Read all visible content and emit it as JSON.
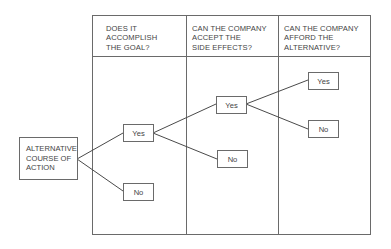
{
  "diagram": {
    "type": "decision-tree",
    "root": {
      "label_lines": [
        "ALTERNATIVE",
        "COURSE OF",
        "ACTION"
      ]
    },
    "columns": [
      {
        "header_lines": [
          "DOES IT",
          "ACCOMPLISH",
          "THE GOAL?"
        ]
      },
      {
        "header_lines": [
          "CAN THE COMPANY",
          "ACCEPT THE",
          "SIDE EFFECTS?"
        ]
      },
      {
        "header_lines": [
          "CAN THE COMPANY",
          "AFFORD THE",
          "ALTERNATIVE?"
        ]
      }
    ],
    "nodes": {
      "goal_yes": "Yes",
      "goal_no": "No",
      "side_effects_yes": "Yes",
      "side_effects_no": "No",
      "afford_yes": "Yes",
      "afford_no": "No"
    },
    "edges": [
      {
        "from": "root",
        "to": "goal_yes"
      },
      {
        "from": "root",
        "to": "goal_no"
      },
      {
        "from": "goal_yes",
        "to": "side_effects_yes"
      },
      {
        "from": "goal_yes",
        "to": "side_effects_no"
      },
      {
        "from": "side_effects_yes",
        "to": "afford_yes"
      },
      {
        "from": "side_effects_yes",
        "to": "afford_no"
      }
    ],
    "colors": {
      "line": "#6a6a6a",
      "text": "#444444",
      "background": "#ffffff"
    }
  }
}
